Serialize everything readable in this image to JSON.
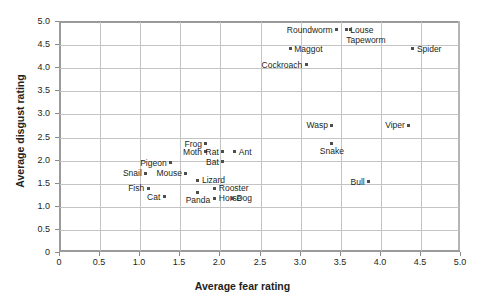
{
  "chart_data": {
    "type": "scatter",
    "title": "",
    "xlabel": "Average fear rating",
    "ylabel": "Average disgust rating",
    "xlim": [
      0,
      5.0
    ],
    "ylim": [
      0,
      5.0
    ],
    "grid": true,
    "legend": "none",
    "xticks": [
      "0",
      "0.5",
      "1.0",
      "1.5",
      "2.0",
      "2.5",
      "3.0",
      "3.5",
      "4.0",
      "4.5",
      "5.0"
    ],
    "yticks": [
      "0",
      "0.5",
      "1.0",
      "1.5",
      "2.0",
      "2.5",
      "3.0",
      "3.5",
      "4.0",
      "4.5",
      "5.0"
    ],
    "xtick_values": [
      0,
      0.5,
      1.0,
      1.5,
      2.0,
      2.5,
      3.0,
      3.5,
      4.0,
      4.5,
      5.0
    ],
    "ytick_values": [
      0,
      0.5,
      1.0,
      1.5,
      2.0,
      2.5,
      3.0,
      3.5,
      4.0,
      4.5,
      5.0
    ],
    "points": [
      {
        "label": "Roundworm",
        "x": 3.45,
        "y": 4.83,
        "pos": "r"
      },
      {
        "label": "Louse",
        "x": 3.57,
        "y": 4.83,
        "pos": "l"
      },
      {
        "label": "Tapeworm",
        "x": 3.62,
        "y": 4.83,
        "pos": "lb"
      },
      {
        "label": "Maggot",
        "x": 2.87,
        "y": 4.42,
        "pos": "l"
      },
      {
        "label": "Spider",
        "x": 4.4,
        "y": 4.42,
        "pos": "l"
      },
      {
        "label": "Cockroach",
        "x": 3.07,
        "y": 4.07,
        "pos": "r"
      },
      {
        "label": "Wasp",
        "x": 3.39,
        "y": 2.77,
        "pos": "r"
      },
      {
        "label": "Viper",
        "x": 4.35,
        "y": 2.77,
        "pos": "r"
      },
      {
        "label": "Snake",
        "x": 3.39,
        "y": 2.36,
        "pos": "b"
      },
      {
        "label": "Bull",
        "x": 3.85,
        "y": 1.54,
        "pos": "r"
      },
      {
        "label": "Frog",
        "x": 1.82,
        "y": 2.36,
        "pos": "r"
      },
      {
        "label": "Moth",
        "x": 1.82,
        "y": 2.19,
        "pos": "r"
      },
      {
        "label": "Rat",
        "x": 2.03,
        "y": 2.19,
        "pos": "r"
      },
      {
        "label": "Ant",
        "x": 2.18,
        "y": 2.19,
        "pos": "l"
      },
      {
        "label": "Bat",
        "x": 2.03,
        "y": 1.97,
        "pos": "r"
      },
      {
        "label": "Pigeon",
        "x": 1.38,
        "y": 1.95,
        "pos": "r"
      },
      {
        "label": "Snail",
        "x": 1.07,
        "y": 1.73,
        "pos": "r"
      },
      {
        "label": "Mouse",
        "x": 1.57,
        "y": 1.73,
        "pos": "r"
      },
      {
        "label": "Lizard",
        "x": 1.72,
        "y": 1.58,
        "pos": "l"
      },
      {
        "label": "Fish",
        "x": 1.1,
        "y": 1.4,
        "pos": "r"
      },
      {
        "label": "Rooster",
        "x": 1.93,
        "y": 1.4,
        "pos": "l"
      },
      {
        "label": "Cat",
        "x": 1.3,
        "y": 1.22,
        "pos": "r"
      },
      {
        "label": "Horse",
        "x": 1.93,
        "y": 1.19,
        "pos": "l"
      },
      {
        "label": "Dog",
        "x": 2.15,
        "y": 1.19,
        "pos": "l"
      },
      {
        "label": "Panda",
        "x": 1.72,
        "y": 1.3,
        "pos": "b"
      }
    ],
    "marker_color": "#4d4d4d",
    "grid_color": "#c4c4c4",
    "axis_color": "#9a9a9a"
  }
}
